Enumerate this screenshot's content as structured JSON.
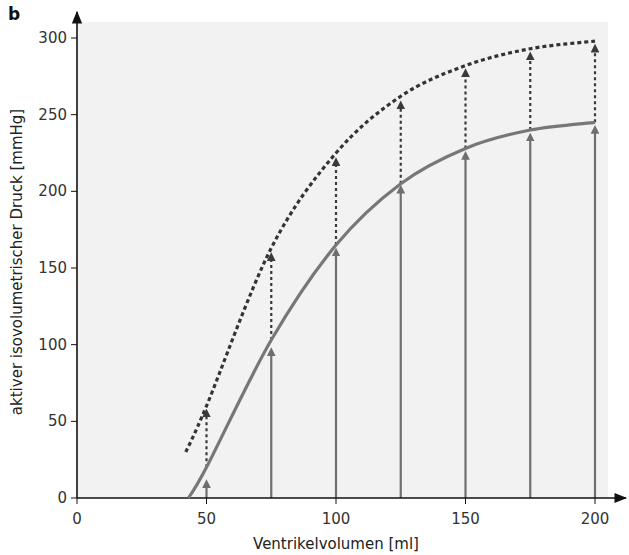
{
  "panel_label": "b",
  "chart_data": {
    "type": "line",
    "title": "",
    "xlabel": "Ventrikelvolumen [ml]",
    "ylabel": "aktiver isovolumetrischer Druck [mmHg]",
    "xlim": [
      0,
      210
    ],
    "ylim": [
      0,
      310
    ],
    "x_ticks": [
      0,
      50,
      100,
      150,
      200
    ],
    "y_ticks": [
      0,
      50,
      100,
      150,
      200,
      250,
      300
    ],
    "grid": false,
    "background": "#f2f2f2",
    "series": [
      {
        "name": "solid-curve",
        "style": "solid",
        "color": "#777777",
        "x": [
          43,
          50,
          75,
          100,
          125,
          150,
          175,
          200
        ],
        "y": [
          0,
          20,
          103,
          165,
          205,
          228,
          240,
          245
        ]
      },
      {
        "name": "dotted-curve",
        "style": "dotted",
        "color": "#333333",
        "x": [
          42,
          50,
          75,
          100,
          125,
          150,
          175,
          200
        ],
        "y": [
          30,
          60,
          163,
          225,
          262,
          282,
          293,
          298
        ]
      }
    ],
    "arrows": {
      "x": [
        50,
        75,
        100,
        125,
        150,
        175,
        200
      ],
      "solid_to": [
        12,
        98,
        163,
        204,
        226,
        238,
        243
      ],
      "dotted_from": [
        20,
        103,
        165,
        205,
        228,
        240,
        245
      ],
      "dotted_to": [
        58,
        160,
        222,
        259,
        280,
        291,
        296
      ]
    }
  }
}
